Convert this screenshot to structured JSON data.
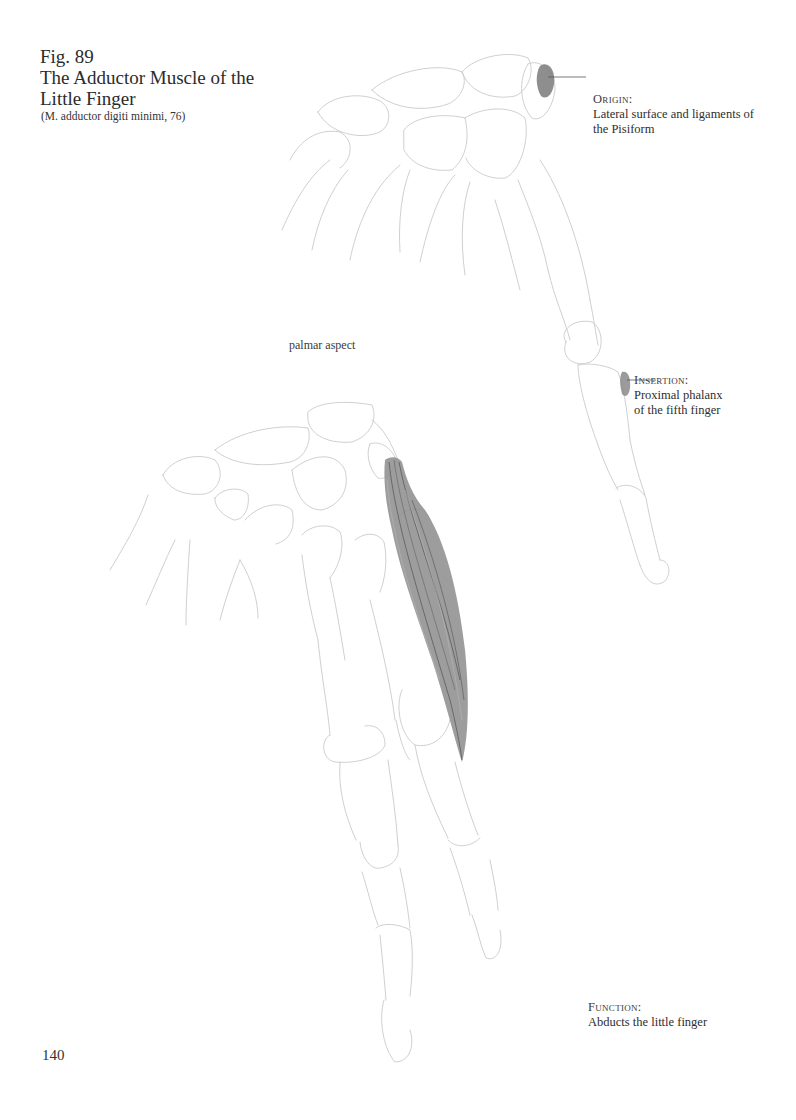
{
  "figure": {
    "number": "Fig. 89",
    "title_line1": "The Adductor Muscle of the",
    "title_line2": "Little Finger",
    "latin_name": "(M. adductor digiti minimi, 76)"
  },
  "annotations": {
    "origin": {
      "heading": "Origin:",
      "line1": "Lateral surface and ligaments of",
      "line2": "the Pisiform"
    },
    "insertion": {
      "heading": "Insertion:",
      "line1": "Proximal phalanx",
      "line2": "of the fifth finger"
    },
    "function": {
      "heading": "Function:",
      "line1": "Abducts the little finger"
    }
  },
  "view_label": "palmar aspect",
  "page_number": "140",
  "colors": {
    "text": "#2b2b2b",
    "bone_outline": "#c9c9c9",
    "muscle_shading": "#6e6e6e",
    "attachment_marker": "#7a7a7a"
  },
  "illustrations": [
    {
      "name": "top-hand-skeleton",
      "description": "pencil outline of hand bones with origin and insertion markers"
    },
    {
      "name": "bottom-hand-skeleton",
      "description": "pencil outline of hand bones with adductor digiti minimi muscle"
    }
  ]
}
